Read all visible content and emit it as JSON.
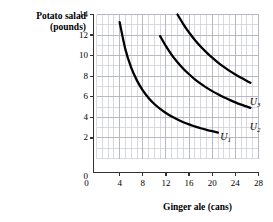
{
  "chart_data": {
    "type": "line",
    "title": "",
    "xlabel": "Ginger ale (cans)",
    "ylabel_line1": "Potato salad",
    "ylabel_line2": "(pounds)",
    "xlim": [
      0,
      28
    ],
    "ylim": [
      0,
      14
    ],
    "xticks": [
      0,
      4,
      8,
      12,
      16,
      20,
      24,
      28
    ],
    "yticks": [
      0,
      2,
      4,
      6,
      8,
      10,
      12,
      14
    ],
    "xtick_labels": [
      "0",
      "4",
      "8",
      "12",
      "16",
      "20",
      "24",
      "28"
    ],
    "ytick_labels": [
      "0",
      "2",
      "4",
      "6",
      "8",
      "10",
      "12",
      "14"
    ],
    "grid": true,
    "grid_spacing_x": 1,
    "grid_spacing_y": 1,
    "grid_color": "#c9c9d4",
    "axis_color": "#333333",
    "curve_color": "#000000",
    "legend_position": "inline-right-of-curve",
    "series": [
      {
        "name": "U1",
        "label": "U",
        "subscript": "1",
        "constant": 53,
        "x_start": 4.0,
        "x_end": 21.0,
        "label_x": 21.9,
        "label_y": 2.05,
        "points": [
          {
            "x": 4.0,
            "y": 13.25
          },
          {
            "x": 5.0,
            "y": 10.6
          },
          {
            "x": 6.0,
            "y": 8.83
          },
          {
            "x": 7.0,
            "y": 7.57
          },
          {
            "x": 8.0,
            "y": 6.63
          },
          {
            "x": 9.0,
            "y": 5.89
          },
          {
            "x": 10.0,
            "y": 5.3
          },
          {
            "x": 11.0,
            "y": 4.82
          },
          {
            "x": 12.0,
            "y": 4.42
          },
          {
            "x": 13.0,
            "y": 4.08
          },
          {
            "x": 14.0,
            "y": 3.79
          },
          {
            "x": 15.0,
            "y": 3.53
          },
          {
            "x": 16.0,
            "y": 3.31
          },
          {
            "x": 17.0,
            "y": 3.12
          },
          {
            "x": 18.0,
            "y": 2.94
          },
          {
            "x": 19.0,
            "y": 2.79
          },
          {
            "x": 20.0,
            "y": 2.65
          },
          {
            "x": 21.0,
            "y": 2.52
          }
        ]
      },
      {
        "name": "U2",
        "label": "U",
        "subscript": "2",
        "constant": 131,
        "x_start": 11.0,
        "x_end": 26.6,
        "label_x": 27.0,
        "label_y": 3.1,
        "points": [
          {
            "x": 11.0,
            "y": 11.9
          },
          {
            "x": 12.0,
            "y": 10.92
          },
          {
            "x": 13.0,
            "y": 10.08
          },
          {
            "x": 14.0,
            "y": 9.36
          },
          {
            "x": 15.0,
            "y": 8.73
          },
          {
            "x": 16.0,
            "y": 8.19
          },
          {
            "x": 17.0,
            "y": 7.7
          },
          {
            "x": 18.0,
            "y": 7.28
          },
          {
            "x": 19.0,
            "y": 6.89
          },
          {
            "x": 20.0,
            "y": 6.55
          },
          {
            "x": 21.0,
            "y": 6.24
          },
          {
            "x": 22.0,
            "y": 5.95
          },
          {
            "x": 23.0,
            "y": 5.7
          },
          {
            "x": 24.0,
            "y": 5.46
          },
          {
            "x": 25.0,
            "y": 5.24
          },
          {
            "x": 26.0,
            "y": 5.04
          },
          {
            "x": 26.6,
            "y": 4.92
          }
        ]
      },
      {
        "name": "U3",
        "label": "U",
        "subscript": "3",
        "constant": 196,
        "x_start": 14.0,
        "x_end": 26.6,
        "label_x": 27.0,
        "label_y": 5.45,
        "points": [
          {
            "x": 14.0,
            "y": 14.0
          },
          {
            "x": 15.0,
            "y": 13.07
          },
          {
            "x": 16.0,
            "y": 12.25
          },
          {
            "x": 17.0,
            "y": 11.53
          },
          {
            "x": 18.0,
            "y": 10.89
          },
          {
            "x": 19.0,
            "y": 10.32
          },
          {
            "x": 20.0,
            "y": 9.8
          },
          {
            "x": 21.0,
            "y": 9.33
          },
          {
            "x": 22.0,
            "y": 8.91
          },
          {
            "x": 23.0,
            "y": 8.52
          },
          {
            "x": 24.0,
            "y": 8.17
          },
          {
            "x": 25.0,
            "y": 7.84
          },
          {
            "x": 26.0,
            "y": 7.54
          },
          {
            "x": 26.6,
            "y": 7.37
          }
        ]
      }
    ]
  }
}
